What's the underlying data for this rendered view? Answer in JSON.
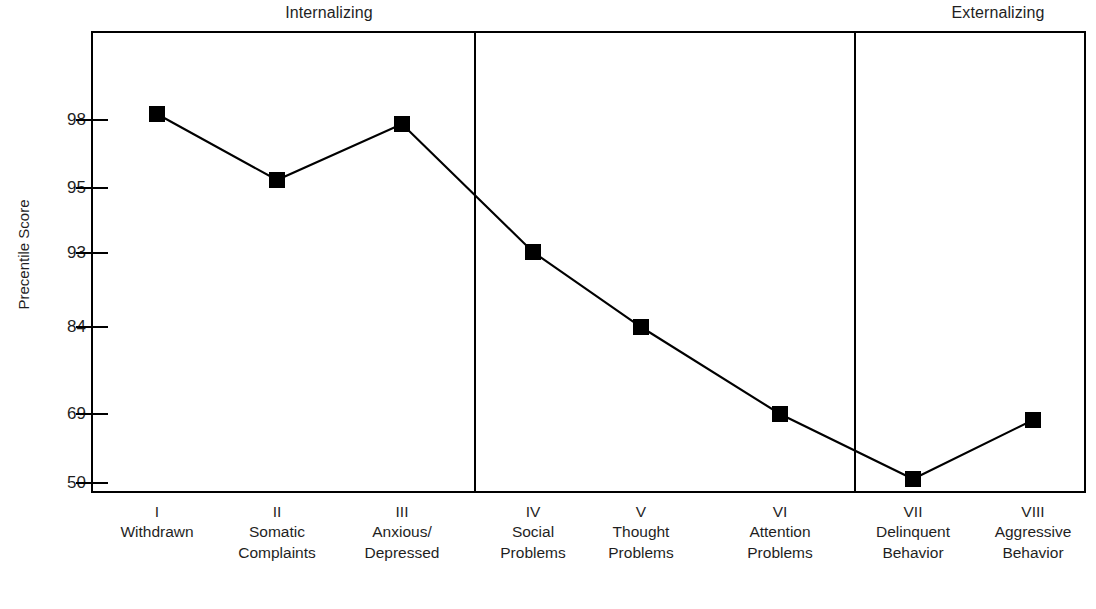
{
  "chart_data": {
    "type": "line",
    "title": "",
    "subtitle": "",
    "xlabel": "",
    "ylabel": "Precentile Score",
    "grid": false,
    "legend": null,
    "y_tick_labels": [
      "98",
      "95",
      "93",
      "84",
      "69",
      "50"
    ],
    "y_tick_values": [
      98,
      95,
      93,
      84,
      69,
      50
    ],
    "ylim": [
      50,
      100
    ],
    "y_scale_note": "non-linear percentile axis; ticks evenly spaced by position",
    "categories": [
      "Withdrawn",
      "Somatic Complaints",
      "Anxious/Depressed",
      "Social Problems",
      "Thought Problems",
      "Attention Problems",
      "Delinquent Behavior",
      "Aggressive Behavior"
    ],
    "category_numerals": [
      "I",
      "II",
      "III",
      "IV",
      "V",
      "VI",
      "VII",
      "VIII"
    ],
    "values": [
      98,
      95.3,
      97.8,
      93.1,
      84,
      68.5,
      49.8,
      66
    ],
    "series": [
      {
        "name": "Percentile Score",
        "values": [
          98,
          95.3,
          97.8,
          93.1,
          84,
          68.5,
          49.8,
          66
        ],
        "marker": "square",
        "color": "#000000"
      }
    ],
    "annotations": [
      {
        "text": "Internalizing",
        "position": "top",
        "spans": [
          "I",
          "II",
          "III"
        ]
      },
      {
        "text": "Externalizing",
        "position": "top",
        "spans": [
          "VII",
          "VIII"
        ]
      }
    ],
    "dividers": [
      {
        "after_category": "Anxious/Depressed"
      },
      {
        "after_category": "Attention Problems"
      }
    ]
  },
  "axes": {
    "y_title": "Precentile Score",
    "ticks": [
      {
        "label": "98",
        "y": 120
      },
      {
        "label": "95",
        "y": 188
      },
      {
        "label": "93",
        "y": 253
      },
      {
        "label": "84",
        "y": 327
      },
      {
        "label": "69",
        "y": 414
      },
      {
        "label": "50",
        "y": 483
      }
    ]
  },
  "sections": {
    "internalizing": "Internalizing",
    "externalizing": "Externalizing"
  },
  "x_categories": [
    {
      "numeral": "I",
      "line1": "Withdrawn",
      "line2": "",
      "x": 157
    },
    {
      "numeral": "II",
      "line1": "Somatic",
      "line2": "Complaints",
      "x": 277
    },
    {
      "numeral": "III",
      "line1": "Anxious/",
      "line2": "Depressed",
      "x": 402
    },
    {
      "numeral": "IV",
      "line1": "Social",
      "line2": "Problems",
      "x": 533
    },
    {
      "numeral": "V",
      "line1": "Thought",
      "line2": "Problems",
      "x": 641
    },
    {
      "numeral": "VI",
      "line1": "Attention",
      "line2": "Problems",
      "x": 780
    },
    {
      "numeral": "VII",
      "line1": "Delinquent",
      "line2": "Behavior",
      "x": 913
    },
    {
      "numeral": "VIII",
      "line1": "Aggressive",
      "line2": "Behavior",
      "x": 1033
    }
  ],
  "points": [
    {
      "label": "Withdrawn",
      "value": "98",
      "x": 157,
      "y": 114
    },
    {
      "label": "Somatic Complaints",
      "value": "95.3",
      "x": 277,
      "y": 180
    },
    {
      "label": "Anxious/Depressed",
      "value": "97.8",
      "x": 402,
      "y": 124
    },
    {
      "label": "Social Problems",
      "value": "93.1",
      "x": 533,
      "y": 252
    },
    {
      "label": "Thought Problems",
      "value": "84",
      "x": 641,
      "y": 327
    },
    {
      "label": "Attention Problems",
      "value": "68.5",
      "x": 780,
      "y": 414
    },
    {
      "label": "Delinquent Behavior",
      "value": "49.8",
      "x": 913,
      "y": 479
    },
    {
      "label": "Aggressive Behavior",
      "value": "66",
      "x": 1033,
      "y": 420
    }
  ],
  "frame": {
    "left": 92,
    "top": 32,
    "right": 1085,
    "bottom": 492
  },
  "divider_x": [
    475,
    855
  ],
  "colors": {
    "line": "#000000",
    "marker": "#000000",
    "frame": "#000000",
    "text": "#1f1f1f"
  }
}
